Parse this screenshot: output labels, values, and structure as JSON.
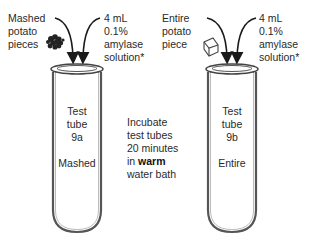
{
  "left": {
    "sample_label": [
      "Mashed",
      "potato",
      "pieces"
    ],
    "reagent_label": [
      "4 mL",
      "0.1%",
      "amylase",
      "solution*"
    ],
    "tube_label": [
      "Test",
      "tube",
      "9a"
    ],
    "tube_state": "Mashed",
    "sample_icon": "mashed-potato-pieces-icon"
  },
  "center_note": {
    "lines": [
      "Incubate",
      "test tubes",
      "20 minutes"
    ],
    "line4_prefix": "in ",
    "line4_bold": "warm",
    "line5": "water bath"
  },
  "right": {
    "sample_label": [
      "Entire",
      "potato",
      "piece"
    ],
    "reagent_label": [
      "4 mL",
      "0.1%",
      "amylase",
      "solution*"
    ],
    "tube_label": [
      "Test",
      "tube",
      "9b"
    ],
    "tube_state": "Entire",
    "sample_icon": "potato-cube-icon"
  },
  "colors": {
    "stroke": "#333333",
    "tube_outline": "#555555",
    "text": "#2a2a2a"
  }
}
